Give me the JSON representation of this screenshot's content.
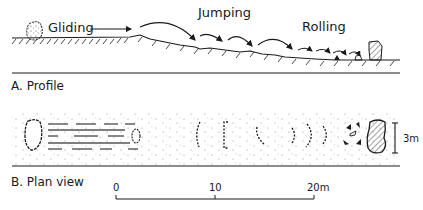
{
  "profile": {
    "labels": {
      "gliding": "Gliding",
      "jumping": "Jumping",
      "rolling": "Rolling"
    },
    "caption": "A. Profile"
  },
  "plan": {
    "caption": "B. Plan view",
    "width_label": "3m"
  },
  "scale_bar": {
    "ticks": [
      "0",
      "10",
      "20m"
    ]
  },
  "colors": {
    "ink": "#1a1a1a",
    "background": "#ffffff"
  }
}
